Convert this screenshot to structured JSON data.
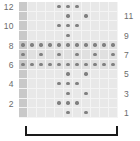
{
  "figure": {
    "title": "",
    "grid": {
      "rows": 12,
      "cols": 11,
      "background_color": "#e8e8e8",
      "first_column_color": "#c9c9c9",
      "dot_color": "#808080",
      "gridline_color": "#f4f4f4"
    },
    "axis_left": {
      "name": "even-row-labels",
      "labels": [
        "12",
        "",
        "10",
        "",
        "8",
        "",
        "6",
        "",
        "4",
        "",
        "2",
        ""
      ]
    },
    "axis_right": {
      "name": "odd-row-labels",
      "labels": [
        "",
        "11",
        "",
        "9",
        "",
        "7",
        "",
        "5",
        "",
        "3",
        "",
        "1"
      ]
    },
    "bracket": {
      "label": "",
      "color": "#1a1a1a"
    }
  },
  "chart_data": {
    "type": "heatmap",
    "title": "",
    "xlabel": "",
    "ylabel": "",
    "x": [
      1,
      2,
      3,
      4,
      5,
      6,
      7,
      8,
      9,
      10,
      11
    ],
    "y": [
      12,
      11,
      10,
      9,
      8,
      7,
      6,
      5,
      4,
      3,
      2,
      1
    ],
    "grid": true,
    "legend": "none",
    "note": "Dot presence matrix, 12 rows (top=12 .. bottom=1) by 11 columns; 1 = dot present",
    "matrix": [
      [
        0,
        0,
        0,
        0,
        1,
        1,
        1,
        0,
        0,
        0,
        0
      ],
      [
        0,
        0,
        0,
        0,
        0,
        1,
        0,
        1,
        0,
        0,
        0
      ],
      [
        0,
        0,
        0,
        0,
        1,
        1,
        1,
        0,
        0,
        0,
        0
      ],
      [
        0,
        0,
        0,
        0,
        0,
        1,
        0,
        0,
        0,
        0,
        0
      ],
      [
        1,
        1,
        1,
        1,
        1,
        1,
        1,
        1,
        1,
        1,
        1
      ],
      [
        1,
        0,
        1,
        0,
        1,
        0,
        1,
        0,
        1,
        0,
        1
      ],
      [
        1,
        1,
        1,
        1,
        1,
        1,
        1,
        1,
        1,
        1,
        1
      ],
      [
        0,
        0,
        0,
        0,
        0,
        1,
        0,
        1,
        0,
        0,
        0
      ],
      [
        0,
        0,
        0,
        0,
        1,
        1,
        1,
        0,
        0,
        0,
        0
      ],
      [
        0,
        0,
        0,
        0,
        0,
        1,
        0,
        1,
        0,
        0,
        0
      ],
      [
        0,
        0,
        0,
        0,
        1,
        1,
        1,
        0,
        0,
        0,
        0
      ],
      [
        0,
        0,
        0,
        0,
        0,
        1,
        0,
        1,
        0,
        0,
        0
      ]
    ],
    "shaded_rows": [
      4,
      5,
      6
    ],
    "shaded_column": 0
  }
}
